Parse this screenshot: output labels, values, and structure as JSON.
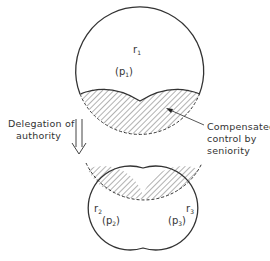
{
  "diagram": {
    "type": "delegation-of-authority-illustration",
    "colors": {
      "stroke": "#333333",
      "hatch": "#555555",
      "background": "#ffffff"
    },
    "top_unit": {
      "role_label": "r",
      "role_sub": "1",
      "power_label": "(p",
      "power_sub": "1",
      "power_close": ")"
    },
    "bottom_units": [
      {
        "role_label": "r",
        "role_sub": "2",
        "power_label": "(p",
        "power_sub": "2",
        "power_close": ")"
      },
      {
        "role_label": "r",
        "role_sub": "3",
        "power_label": "(p",
        "power_sub": "3",
        "power_close": ")"
      }
    ],
    "arrow_label": {
      "line1": "Delegation of",
      "line2": "authority"
    },
    "annotation": {
      "line1": "Compensated",
      "line2": "control by",
      "line3": "seniority"
    },
    "icons": {
      "transition_arrow": "double-down-arrow-icon",
      "pointer": "leader-arrow-icon"
    }
  }
}
